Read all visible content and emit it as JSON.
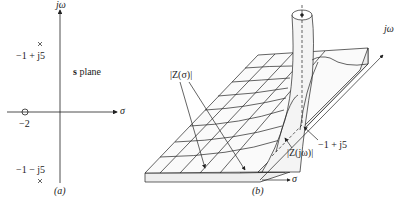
{
  "panel_a": {
    "caption": "(a)",
    "plane_label_bold": "s",
    "plane_label_rest": " plane",
    "vertical_axis_label": "jω",
    "horizontal_axis_label": "σ",
    "zero": {
      "label": "−2",
      "marker": "circle"
    },
    "poles": [
      {
        "label": "−1 + j5",
        "marker": "cross"
      },
      {
        "label": "−1 − j5",
        "marker": "cross"
      }
    ]
  },
  "panel_b": {
    "caption": "(b)",
    "axis_jw_label": "jω",
    "axis_sigma_label": "σ",
    "z_sigma_label": "|Z(σ)|",
    "z_jw_label": "|Z(jω)|",
    "pole_label": "−1 + j5"
  }
}
